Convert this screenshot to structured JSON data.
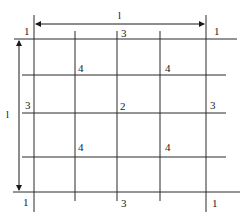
{
  "diagram": {
    "type": "grid-with-dimensions",
    "colors": {
      "line": "#2a2a2a",
      "text": "#222222",
      "background": "#ffffff"
    },
    "dimensions": {
      "top": {
        "label": "l"
      },
      "left": {
        "label": "l"
      }
    },
    "node_labels": {
      "corner_top_left": "1",
      "corner_top_right": "1",
      "corner_bottom_left": "1",
      "corner_bottom_right": "1",
      "edge_top_mid": "3",
      "edge_bottom_mid": "3",
      "edge_left_mid": "3",
      "edge_right_mid": "3",
      "inner_top_left": "4",
      "inner_top_right": "4",
      "inner_bottom_left": "4",
      "inner_bottom_right": "4",
      "center": "2"
    }
  }
}
